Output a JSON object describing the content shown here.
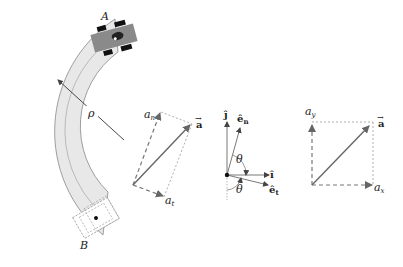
{
  "figure": {
    "track": {
      "point_start": "A",
      "point_end": "B",
      "radius_label": "ρ",
      "colors": {
        "track_fill": "#e8e8e8",
        "track_edge": "#888888",
        "car_body": "#8a8a8a",
        "wheel": "#111111"
      }
    },
    "normal_tangential_panel": {
      "a_n_label": "a",
      "a_n_sub": "n",
      "a_t_label": "a",
      "a_t_sub": "t",
      "a_vec_label": "a"
    },
    "unit_vector_panel": {
      "j_label": "ĵ",
      "i_label": "î",
      "e_n_label": "ê",
      "e_n_sub": "n",
      "e_t_label": "ê",
      "e_t_sub": "t",
      "theta_upper": "θ",
      "theta_lower": "θ"
    },
    "cartesian_panel": {
      "a_y_label": "a",
      "a_y_sub": "y",
      "a_x_label": "a",
      "a_x_sub": "x",
      "a_vec_label": "a"
    },
    "colors": {
      "vector": "#666666",
      "dashed": "#888888",
      "text": "#222222"
    }
  }
}
